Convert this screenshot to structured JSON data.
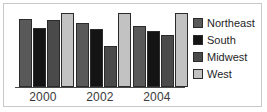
{
  "chart_data": {
    "type": "bar",
    "title": "",
    "subtitle": "",
    "xlabel": "",
    "ylabel": "",
    "categories": [
      "2000",
      "2002",
      "2004"
    ],
    "series": [
      {
        "name": "Northeast",
        "color": "#595959",
        "values": [
          92,
          87,
          83
        ]
      },
      {
        "name": "South",
        "color": "#141414",
        "values": [
          80,
          78,
          76
        ]
      },
      {
        "name": "Midwest",
        "color": "#4a4a4a",
        "values": [
          90,
          55,
          70
        ]
      },
      {
        "name": "West",
        "color": "#c2c2c2",
        "values": [
          100,
          100,
          100
        ]
      }
    ],
    "ylim": [
      0,
      100
    ],
    "grid": false,
    "legend_position": "right",
    "axis_color": "#4a4a4a",
    "bar_outline_color": "#2b2b2b",
    "background": "#ffffff",
    "border_color": "#c9c9c9"
  },
  "legend": {
    "items": [
      {
        "label": "Northeast",
        "swatch": "northeast"
      },
      {
        "label": "South",
        "swatch": "south"
      },
      {
        "label": "Midwest",
        "swatch": "midwest"
      },
      {
        "label": "West",
        "swatch": "west"
      }
    ]
  },
  "axis": {
    "ticks": [
      "2000",
      "2002",
      "2004"
    ]
  }
}
